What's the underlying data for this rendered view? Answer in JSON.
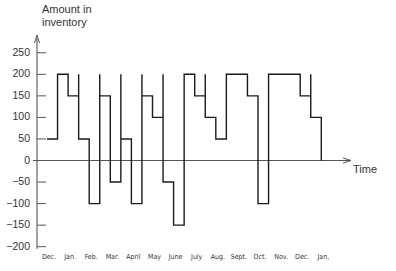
{
  "chart_data": {
    "type": "line",
    "style": "step",
    "title": "",
    "ylabel_lines": [
      "Amount in",
      "inventory"
    ],
    "xlabel": "Time",
    "ylim": [
      -200,
      250
    ],
    "yticks": [
      250,
      200,
      150,
      100,
      50,
      0,
      -50,
      -100,
      -150,
      -200
    ],
    "ytick_labels": [
      "250",
      "200",
      "150",
      "100",
      "50",
      "0",
      "−50",
      "−100",
      "−150",
      "−200"
    ],
    "x_tick_labels": [
      "Dec.",
      "Jan.",
      "Feb.",
      "Mar.",
      "April",
      "May",
      "June",
      "July",
      "Aug.",
      "Sept.",
      "Oct.",
      "Nov.",
      "Dec.",
      "Jan,"
    ],
    "grid": false,
    "legend": null,
    "x_unit": "half-month periods starting at Dec.",
    "series": [
      {
        "name": "Amount in inventory",
        "segments": [
          {
            "start": 0,
            "end": 1,
            "level": 50
          },
          {
            "start": 1,
            "end": 2,
            "level": 200
          },
          {
            "start": 2,
            "end": 3,
            "level": 150
          },
          {
            "start": 3,
            "end": 4,
            "level": 50,
            "restock_spike_to": 200
          },
          {
            "start": 4,
            "end": 5,
            "level": -100
          },
          {
            "start": 5,
            "end": 6,
            "level": 150,
            "restock_spike_to": 200
          },
          {
            "start": 6,
            "end": 7,
            "level": -50
          },
          {
            "start": 7,
            "end": 8,
            "level": 50,
            "restock_spike_to": 200
          },
          {
            "start": 8,
            "end": 9,
            "level": -100
          },
          {
            "start": 9,
            "end": 10,
            "level": 150,
            "restock_spike_to": 200
          },
          {
            "start": 10,
            "end": 11,
            "level": 100
          },
          {
            "start": 11,
            "end": 12,
            "level": -50,
            "restock_spike_to": 200
          },
          {
            "start": 12,
            "end": 13,
            "level": -150
          },
          {
            "start": 13,
            "end": 14,
            "level": 200
          },
          {
            "start": 14,
            "end": 15,
            "level": 150
          },
          {
            "start": 15,
            "end": 16,
            "level": 100,
            "restock_spike_to": 200
          },
          {
            "start": 16,
            "end": 17,
            "level": 50
          },
          {
            "start": 17,
            "end": 19,
            "level": 200
          },
          {
            "start": 19,
            "end": 20,
            "level": 150
          },
          {
            "start": 20,
            "end": 21,
            "level": -100
          },
          {
            "start": 21,
            "end": 24,
            "level": 200
          },
          {
            "start": 24,
            "end": 25,
            "level": 150
          },
          {
            "start": 25,
            "end": 26,
            "level": 100,
            "restock_spike_to": 200
          }
        ],
        "final_level": 0
      }
    ]
  },
  "colors": {
    "line": "#1a1a1a",
    "axis": "#555555",
    "text": "#333333"
  }
}
